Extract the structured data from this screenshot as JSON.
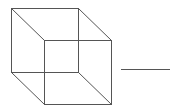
{
  "diagram": {
    "type": "necker-cube",
    "stroke_color": "#555555",
    "background": "#ffffff",
    "back_face": {
      "x1": 11,
      "y1": 8,
      "x2": 78,
      "y2": 72
    },
    "front_face": {
      "x1": 44,
      "y1": 40,
      "x2": 111,
      "y2": 104
    },
    "answer_line": {
      "x1": 120,
      "y1": 69,
      "x2": 169,
      "y2": 69
    }
  }
}
